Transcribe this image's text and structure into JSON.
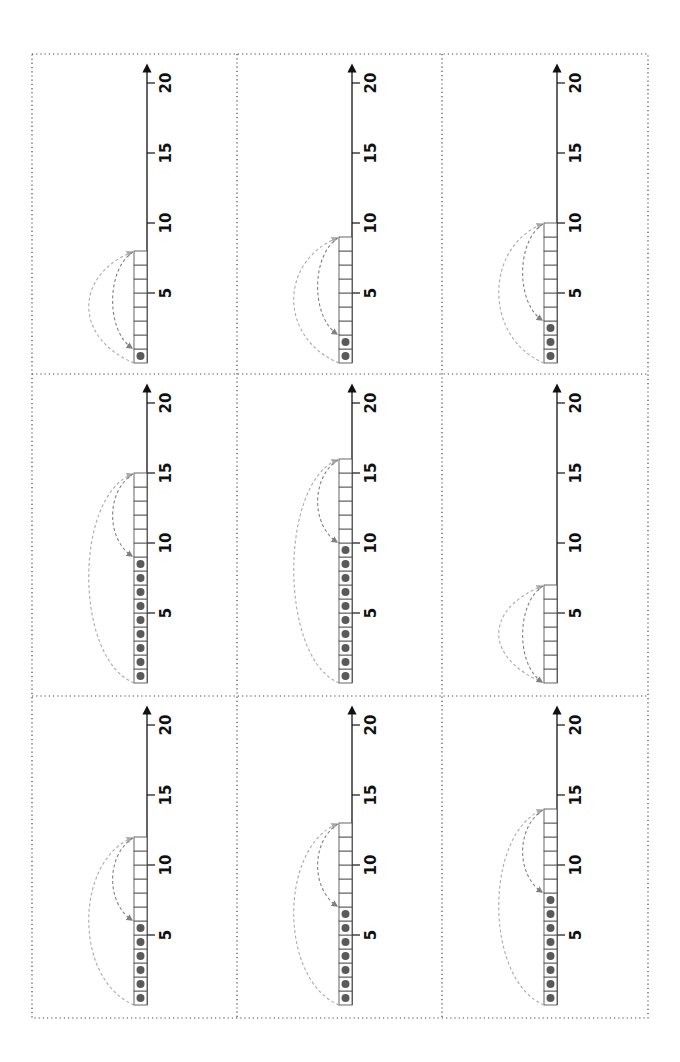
{
  "worksheet": {
    "layout": {
      "rows": 3,
      "columns": 3
    },
    "axis": {
      "min": 0,
      "max": 20,
      "labeled_ticks": [
        5,
        10,
        15,
        20
      ]
    },
    "colors": {
      "axis": "#111111",
      "box_border": "#555555",
      "dot": "#5a5a5a",
      "outer_arc": "#aaaaaa",
      "inner_arc": "#808080",
      "grid_border": "#444444"
    },
    "cells": [
      {
        "total_boxes": 8,
        "filled_dots": 1
      },
      {
        "total_boxes": 9,
        "filled_dots": 2
      },
      {
        "total_boxes": 10,
        "filled_dots": 3
      },
      {
        "total_boxes": 15,
        "filled_dots": 9
      },
      {
        "total_boxes": 16,
        "filled_dots": 10
      },
      {
        "total_boxes": 7,
        "filled_dots": 0
      },
      {
        "total_boxes": 12,
        "filled_dots": 6
      },
      {
        "total_boxes": 13,
        "filled_dots": 7
      },
      {
        "total_boxes": 14,
        "filled_dots": 8
      }
    ]
  }
}
